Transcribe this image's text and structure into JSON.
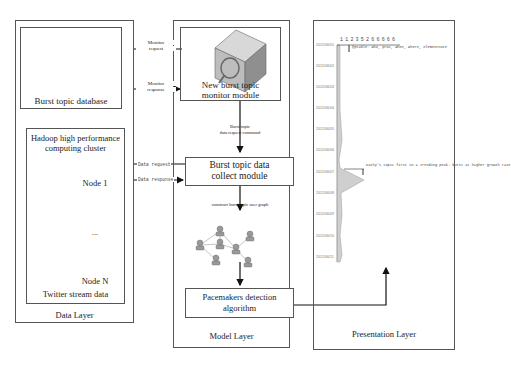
{
  "layers": {
    "data": {
      "label": "Data Layer",
      "database": {
        "label": "Burst topic database",
        "icon": "server-database-icon"
      },
      "cluster": {
        "title_line1": "Hadoop high performance",
        "title_line2": "computing cluster",
        "footer": "Twitter stream data",
        "nodes": [
          {
            "label": "Node 1"
          },
          {
            "label": "..."
          },
          {
            "label": "Node N"
          }
        ]
      }
    },
    "model": {
      "label": "Model Layer",
      "monitor": {
        "line1": "New burst topic",
        "line2": "monitor module",
        "icon": "monitor-search-icon"
      },
      "cmd_label_line1": "Burst topic",
      "cmd_label_line2": "data request command",
      "collect": {
        "line1": "Burst topic data",
        "line2": "collect module"
      },
      "graph_label": "construct burst topic user graph",
      "pacemaker": {
        "line1": "Pacemakers detection",
        "line2": "algorithm"
      }
    },
    "presentation": {
      "label": "Presentation Layer",
      "timeline": {
        "header_ticks": [
          "1",
          "1",
          "2",
          "3",
          "5",
          "2",
          "6",
          "6",
          "6",
          "6",
          "6"
        ],
        "dates": [
          "2012/06/01",
          "2012/06/02",
          "2012/06/03",
          "2012/06/04",
          "2012/06/05",
          "2012/06/06",
          "2012/06/07",
          "2012/06/08",
          "2012/06/09",
          "2012/06/10",
          "2012/06/11"
        ],
        "annotation_top": "@ptable: who, proc, when, where, elementnote",
        "annotation_peak": "Kathy's topic first to a trending peak: burst at higher growth rate"
      }
    }
  },
  "arrows": {
    "monitor_request_line1": "Monitor",
    "monitor_request_line2": "request",
    "monitor_response_line1": "Monitor",
    "monitor_response_line2": "response",
    "data_request": "Data request",
    "data_response": "Data response"
  }
}
